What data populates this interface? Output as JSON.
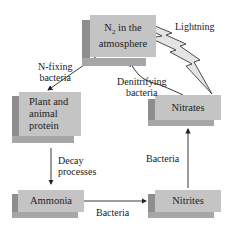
{
  "nodes": {
    "n2": {
      "line1_pre": "N",
      "sub": "2",
      "line1_post": " in the",
      "line2": "atmosphere"
    },
    "plant": {
      "line1": "Plant and",
      "line2": "animal",
      "line3": "protein"
    },
    "nitrates": {
      "label": "Nitrates"
    },
    "ammonia": {
      "label": "Ammonia"
    },
    "nitrites": {
      "label": "Nitrites"
    }
  },
  "edges": {
    "n_fixing": {
      "line1": "N-fixing",
      "line2": "bacteria"
    },
    "denitrifying": {
      "line1": "Denitrifying",
      "line2": "bacteria"
    },
    "lightning": {
      "label": "Lightning"
    },
    "decay": {
      "line1": "Decay",
      "line2": "processes"
    },
    "ammonia_to_nitrites": {
      "label": "Bacteria"
    },
    "nitrites_to_nitrates": {
      "label": "Bacteria"
    }
  },
  "colors": {
    "box_face": "#c4c4c4",
    "box_side": "#8e8e8e",
    "lightning_fill": "#e4e4e4"
  }
}
